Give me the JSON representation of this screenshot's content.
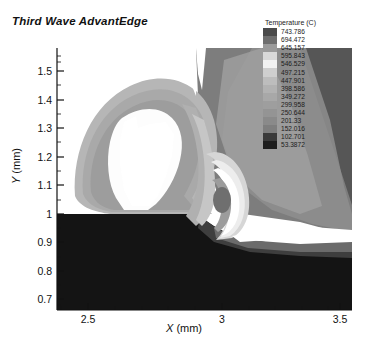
{
  "figure": {
    "title": "Third Wave AdvantEdge",
    "background": "#ffffff"
  },
  "legend": {
    "title": "Temperature (C)",
    "entries": [
      {
        "value": "743.786",
        "color": "#4a4a4a"
      },
      {
        "value": "694.472",
        "color": "#6e6e6e"
      },
      {
        "value": "645.157",
        "color": "#9a9a9a"
      },
      {
        "value": "595.843",
        "color": "#d8d8d8"
      },
      {
        "value": "546.529",
        "color": "#f2f2f2"
      },
      {
        "value": "497.215",
        "color": "#cfcfcf"
      },
      {
        "value": "447.901",
        "color": "#bdbdbd"
      },
      {
        "value": "398.586",
        "color": "#b2b2b2"
      },
      {
        "value": "349.272",
        "color": "#a8a8a8"
      },
      {
        "value": "299.958",
        "color": "#9e9e9e"
      },
      {
        "value": "250.644",
        "color": "#949494"
      },
      {
        "value": "201.33",
        "color": "#8a8a8a"
      },
      {
        "value": "152.016",
        "color": "#7e7e7e"
      },
      {
        "value": "102.701",
        "color": "#3a3a3a"
      },
      {
        "value": "53.3872",
        "color": "#1e1e1e"
      }
    ]
  },
  "axes": {
    "x": {
      "label_var": "X",
      "label_unit": "(mm)",
      "ticks": [
        "2.5",
        "3",
        "3.5"
      ],
      "tick_positions": [
        88,
        222,
        340
      ],
      "range": [
        2.38,
        3.56
      ]
    },
    "y": {
      "label_var": "Y",
      "label_unit": "(mm)",
      "ticks": [
        "1.5",
        "1.4",
        "1.3",
        "1.2",
        "1.1",
        "1",
        "0.9",
        "0.8",
        "0.7"
      ],
      "tick_positions": [
        71,
        100,
        128,
        157,
        185,
        214,
        242,
        271,
        299
      ],
      "range": [
        0.655,
        1.565
      ]
    }
  },
  "chart_data": {
    "type": "heatmap",
    "title": "Third Wave AdvantEdge",
    "subtitle": "Machining chip-formation temperature contour field",
    "xlabel": "X (mm)",
    "ylabel": "Y (mm)",
    "legend_title": "Temperature (C)",
    "legend_position": "top-right",
    "grid": false,
    "xlim": [
      2.38,
      3.56
    ],
    "ylim": [
      0.655,
      1.565
    ],
    "xticks": [
      2.5,
      3.0,
      3.5
    ],
    "yticks": [
      0.7,
      0.8,
      0.9,
      1.0,
      1.1,
      1.2,
      1.3,
      1.4,
      1.5
    ],
    "colorbar_levels": [
      53.3872,
      102.701,
      152.016,
      201.33,
      250.644,
      299.958,
      349.272,
      398.586,
      447.901,
      497.215,
      546.529,
      595.843,
      645.157,
      694.472,
      743.786
    ],
    "level_step": 49.314,
    "value_min": 53.3872,
    "value_max": 743.786,
    "regions": [
      {
        "name": "workpiece-bulk",
        "approx_temp": 53.4,
        "color": "#141414"
      },
      {
        "name": "machined-surface-layer",
        "approx_temp": 152.0,
        "color": "#3c3c3c"
      },
      {
        "name": "subsurface-band",
        "approx_temp": 250.6,
        "color": "#6a6a6a"
      },
      {
        "name": "chip-outer-band",
        "approx_temp": 398.6,
        "color": "#b4b4b4"
      },
      {
        "name": "chip-mid-band",
        "approx_temp": 349.3,
        "color": "#a2a2a2"
      },
      {
        "name": "chip-inner-free-surface",
        "approx_temp": 595.8,
        "color": "#f6f6f6"
      },
      {
        "name": "primary-shear-zone",
        "approx_temp": 546.5,
        "color": "#efefef"
      },
      {
        "name": "tool-chip-interface-hotspot",
        "approx_temp": 743.8,
        "color": "#ffffff"
      },
      {
        "name": "tool-body-gradient",
        "approx_temp": 447.9,
        "color": "#9b9b9b"
      },
      {
        "name": "tool-far-field",
        "approx_temp": 201.3,
        "color": "#5c5c5c"
      }
    ]
  }
}
